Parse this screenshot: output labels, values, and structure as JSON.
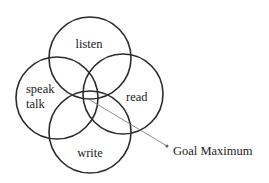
{
  "diagram": {
    "type": "venn",
    "circles": [
      {
        "id": "listen",
        "cx": 90,
        "cy": 58,
        "r": 41,
        "labels": [
          "listen"
        ]
      },
      {
        "id": "speak",
        "cx": 57,
        "cy": 98,
        "r": 41,
        "labels": [
          "speak",
          "talk"
        ]
      },
      {
        "id": "read",
        "cx": 123,
        "cy": 94,
        "r": 40,
        "labels": [
          "read"
        ]
      },
      {
        "id": "write",
        "cx": 90,
        "cy": 132,
        "r": 41,
        "labels": [
          "write"
        ]
      }
    ],
    "texts": {
      "listen": "listen",
      "speak": "speak",
      "talk": "talk",
      "read": "read",
      "write": "write"
    },
    "annotation": {
      "label": "Goal Maximum",
      "from": [
        90,
        100
      ],
      "to": [
        167,
        146
      ]
    },
    "colors": {
      "stroke": "#2b2b2b",
      "pointer": "#808080",
      "text": "#222222"
    }
  }
}
